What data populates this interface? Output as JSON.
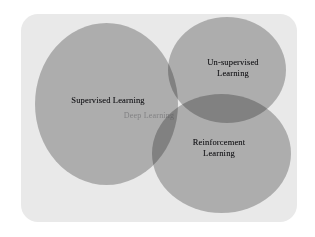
{
  "figure": {
    "name": "machine-learning-venn-diagram",
    "panel_color": "#e9e9e9",
    "circle_color": "#b0b0b0",
    "overlap_color": "#939393",
    "background_color": "#ffffff"
  },
  "chart_data": {
    "type": "venn",
    "title": "",
    "sets": [
      {
        "id": "supervised",
        "label": "Supervised Learning",
        "color": "#b0b0b0",
        "cx": 106,
        "cy": 104,
        "rx": 71,
        "ry": 81
      },
      {
        "id": "unsupervised",
        "label": "Un-supervised\nLearning",
        "color": "#b0b0b0",
        "cx": 227,
        "cy": 70,
        "rx": 59,
        "ry": 53
      },
      {
        "id": "reinforcement",
        "label": "Reinforcement\nLearning",
        "color": "#b0b0b0",
        "cx": 221,
        "cy": 153,
        "rx": 69,
        "ry": 59
      }
    ],
    "intersections": [
      {
        "id": "deep-learning",
        "label": "Deep Learning",
        "sets": [
          "supervised",
          "unsupervised",
          "reinforcement"
        ],
        "color": "#7f7f83"
      }
    ],
    "legend": "none",
    "grid": false
  },
  "labels": {
    "supervised": "Supervised Learning",
    "unsupervised": "Un-supervised\nLearning",
    "reinforcement": "Reinforcement\nLearning",
    "deep": "Deep Learning"
  }
}
